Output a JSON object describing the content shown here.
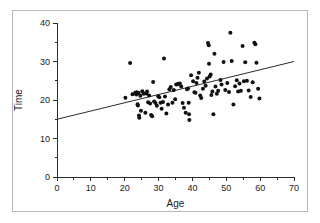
{
  "figure": {
    "border_color": "#b9b9b9",
    "background": "#ffffff"
  },
  "chart_data": {
    "type": "scatter",
    "title": "",
    "xlabel": "Age",
    "ylabel": "Time",
    "xlim": [
      0,
      70
    ],
    "ylim": [
      0,
      40
    ],
    "xticks": [
      0,
      10,
      20,
      30,
      40,
      50,
      60,
      70
    ],
    "yticks": [
      0,
      10,
      20,
      30,
      40
    ],
    "xminor_ticks": [
      5,
      15,
      25,
      35,
      45,
      55,
      65
    ],
    "yminor_ticks": [
      5,
      15,
      25,
      35
    ],
    "xtick_labels": [
      "0",
      "10",
      "20",
      "30",
      "40",
      "50",
      "60",
      "70"
    ],
    "ytick_labels": [
      "0",
      "10",
      "20",
      "30",
      "40"
    ],
    "grid": false,
    "legend": null,
    "marker_color": "#111111",
    "marker_size": 2.0,
    "trendline": {
      "type": "linear-fit",
      "color": "#2b2b2b",
      "x": [
        0,
        70
      ],
      "y": [
        15.0,
        30.0
      ],
      "slope": 0.214,
      "intercept": 15.0
    },
    "points": [
      [
        20.2,
        20.6
      ],
      [
        21.6,
        29.6
      ],
      [
        22.3,
        21.5
      ],
      [
        23.1,
        21.9
      ],
      [
        23.4,
        21.4
      ],
      [
        23.6,
        22.0
      ],
      [
        23.8,
        18.9
      ],
      [
        23.9,
        18.6
      ],
      [
        24.1,
        21.8
      ],
      [
        24.2,
        16.0
      ],
      [
        24.3,
        15.4
      ],
      [
        24.6,
        21.1
      ],
      [
        24.8,
        17.2
      ],
      [
        25.2,
        22.3
      ],
      [
        25.6,
        21.6
      ],
      [
        26.1,
        16.7
      ],
      [
        26.4,
        21.7
      ],
      [
        26.6,
        22.2
      ],
      [
        26.9,
        19.4
      ],
      [
        27.2,
        21.2
      ],
      [
        27.5,
        19.1
      ],
      [
        27.8,
        16.1
      ],
      [
        28.1,
        15.8
      ],
      [
        28.4,
        24.7
      ],
      [
        28.7,
        19.6
      ],
      [
        29.1,
        19.2
      ],
      [
        29.5,
        18.5
      ],
      [
        29.9,
        21.0
      ],
      [
        30.2,
        20.7
      ],
      [
        30.6,
        19.3
      ],
      [
        30.9,
        17.7
      ],
      [
        31.3,
        19.5
      ],
      [
        31.6,
        30.8
      ],
      [
        31.9,
        20.9
      ],
      [
        32.3,
        16.5
      ],
      [
        32.8,
        18.8
      ],
      [
        33.2,
        22.8
      ],
      [
        33.6,
        23.4
      ],
      [
        34.1,
        19.3
      ],
      [
        34.5,
        22.6
      ],
      [
        34.9,
        20.2
      ],
      [
        35.2,
        24.0
      ],
      [
        35.6,
        24.1
      ],
      [
        35.9,
        24.2
      ],
      [
        36.3,
        24.3
      ],
      [
        36.7,
        23.5
      ],
      [
        37.1,
        19.2
      ],
      [
        37.5,
        18.0
      ],
      [
        38.0,
        16.7
      ],
      [
        38.4,
        22.8
      ],
      [
        38.7,
        23.0
      ],
      [
        38.9,
        19.3
      ],
      [
        39.0,
        16.3
      ],
      [
        39.1,
        14.8
      ],
      [
        39.6,
        26.4
      ],
      [
        40.2,
        24.9
      ],
      [
        40.6,
        22.0
      ],
      [
        40.9,
        21.9
      ],
      [
        41.2,
        24.4
      ],
      [
        41.5,
        25.8
      ],
      [
        41.9,
        27.1
      ],
      [
        42.3,
        21.2
      ],
      [
        42.6,
        20.5
      ],
      [
        43.1,
        22.9
      ],
      [
        43.5,
        24.8
      ],
      [
        43.9,
        23.7
      ],
      [
        44.3,
        25.6
      ],
      [
        44.6,
        34.8
      ],
      [
        44.8,
        34.2
      ],
      [
        44.9,
        29.4
      ],
      [
        45.1,
        26.1
      ],
      [
        45.4,
        26.6
      ],
      [
        45.6,
        21.3
      ],
      [
        45.9,
        22.2
      ],
      [
        46.2,
        16.3
      ],
      [
        46.5,
        32.0
      ],
      [
        46.8,
        23.5
      ],
      [
        47.2,
        21.6
      ],
      [
        47.6,
        22.4
      ],
      [
        48.3,
        25.2
      ],
      [
        48.6,
        24.0
      ],
      [
        49.2,
        29.9
      ],
      [
        49.7,
        22.6
      ],
      [
        50.3,
        24.4
      ],
      [
        50.8,
        22.1
      ],
      [
        51.2,
        37.5
      ],
      [
        51.6,
        30.1
      ],
      [
        52.1,
        18.8
      ],
      [
        52.6,
        23.6
      ],
      [
        53.1,
        25.1
      ],
      [
        53.5,
        22.2
      ],
      [
        53.9,
        24.3
      ],
      [
        54.3,
        22.4
      ],
      [
        54.8,
        34.0
      ],
      [
        55.2,
        24.9
      ],
      [
        55.6,
        29.8
      ],
      [
        56.1,
        25.0
      ],
      [
        56.6,
        22.5
      ],
      [
        57.2,
        20.8
      ],
      [
        57.8,
        24.6
      ],
      [
        58.3,
        34.9
      ],
      [
        58.6,
        34.5
      ],
      [
        58.9,
        29.7
      ],
      [
        59.4,
        22.9
      ],
      [
        59.8,
        20.4
      ]
    ]
  }
}
